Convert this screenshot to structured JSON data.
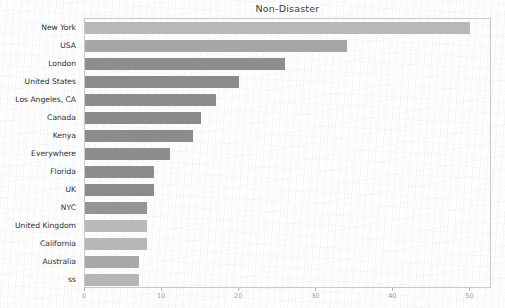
{
  "chart_data": {
    "type": "bar",
    "orientation": "horizontal",
    "title": "Non-Disaster",
    "xlabel": "",
    "ylabel": "",
    "xlim": [
      0,
      52.8
    ],
    "xticks": [
      0,
      10,
      20,
      30,
      40,
      50
    ],
    "xtick_labels": [
      "0",
      "10",
      "20",
      "30",
      "40",
      "50"
    ],
    "grid": false,
    "legend": "none",
    "categories": [
      "New York",
      "USA",
      "London",
      "United States",
      "Los Angeles, CA",
      "Canada",
      "Kenya",
      "Everywhere",
      "Florida",
      "UK",
      "NYC",
      "United Kingdom",
      "California",
      "Australia",
      "ss"
    ],
    "values": [
      50,
      34,
      26,
      20,
      17,
      15,
      14,
      11,
      9,
      9,
      8,
      8,
      8,
      7,
      7
    ],
    "bar_colors": [
      "#b8b8b8",
      "#a6a6a6",
      "#8e8e8e",
      "#8b8b8b",
      "#8c8c8c",
      "#8a8a8a",
      "#8b8b8b",
      "#8d8d8d",
      "#8c8c8c",
      "#8b8b8b",
      "#949494",
      "#b9b9b9",
      "#b7b7b7",
      "#a8a8a8",
      "#b6b6b6"
    ]
  },
  "colors": {
    "background": "#fdfdfd",
    "axis_line": "#c9c9c9",
    "tick_label": "#9a9a9a",
    "category_label": "#2f2f2f",
    "title": "#3b3b3b"
  }
}
